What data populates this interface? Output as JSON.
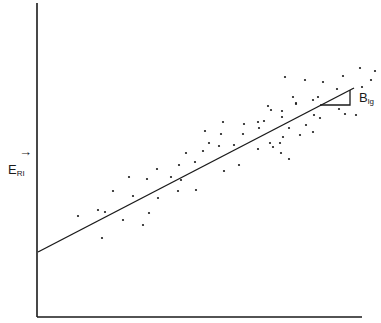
{
  "chart_data": {
    "type": "scatter",
    "title": "",
    "xlabel": "",
    "ylabel": "E_RI",
    "ylabel_main": "E",
    "ylabel_sub": "RI",
    "ylabel_arrow": "→",
    "slope_label": "B_lg",
    "slope_label_main": "B",
    "slope_label_sub": "lg",
    "grid": false,
    "axis_ticks": false,
    "regression_line": {
      "x0": 0,
      "y0": 0.24,
      "x1": 0.98,
      "y1": 0.8,
      "intercept_px": [
        38,
        252
      ],
      "end_px": [
        354,
        88
      ]
    },
    "slope_triangle_px": {
      "a": [
        320,
        105
      ],
      "b": [
        350,
        105
      ],
      "c": [
        350,
        90
      ]
    },
    "points_px": [
      [
        78,
        216
      ],
      [
        98,
        210
      ],
      [
        105,
        212
      ],
      [
        102,
        238
      ],
      [
        113,
        191
      ],
      [
        129,
        177
      ],
      [
        133,
        196
      ],
      [
        147,
        179
      ],
      [
        123,
        220
      ],
      [
        149,
        213
      ],
      [
        143,
        225
      ],
      [
        157,
        169
      ],
      [
        158,
        198
      ],
      [
        171,
        177
      ],
      [
        179,
        165
      ],
      [
        178,
        191
      ],
      [
        181,
        180
      ],
      [
        186,
        153
      ],
      [
        195,
        162
      ],
      [
        196,
        190
      ],
      [
        203,
        151
      ],
      [
        205,
        131
      ],
      [
        209,
        143
      ],
      [
        219,
        146
      ],
      [
        221,
        134
      ],
      [
        223,
        122
      ],
      [
        224,
        171
      ],
      [
        234,
        145
      ],
      [
        239,
        165
      ],
      [
        243,
        134
      ],
      [
        244,
        124
      ],
      [
        258,
        122
      ],
      [
        264,
        121
      ],
      [
        259,
        128
      ],
      [
        258,
        149
      ],
      [
        268,
        106
      ],
      [
        271,
        110
      ],
      [
        270,
        143
      ],
      [
        273,
        147
      ],
      [
        280,
        143
      ],
      [
        281,
        153
      ],
      [
        282,
        111
      ],
      [
        282,
        117
      ],
      [
        283,
        137
      ],
      [
        289,
        128
      ],
      [
        289,
        159
      ],
      [
        285,
        77
      ],
      [
        293,
        97
      ],
      [
        296,
        103
      ],
      [
        296,
        104
      ],
      [
        300,
        135
      ],
      [
        305,
        80
      ],
      [
        306,
        125
      ],
      [
        313,
        100
      ],
      [
        313,
        132
      ],
      [
        314,
        115
      ],
      [
        318,
        97
      ],
      [
        320,
        118
      ],
      [
        323,
        82
      ],
      [
        337,
        89
      ],
      [
        339,
        109
      ],
      [
        343,
        76
      ],
      [
        345,
        114
      ],
      [
        356,
        115
      ],
      [
        360,
        68
      ],
      [
        362,
        87
      ],
      [
        371,
        80
      ],
      [
        375,
        71
      ]
    ]
  },
  "colors": {
    "ink": "#1a1a1a",
    "background": "#ffffff"
  }
}
